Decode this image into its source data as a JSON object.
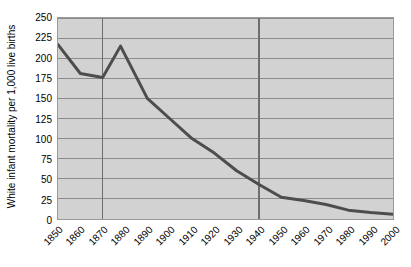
{
  "chart_data": {
    "type": "line",
    "title": "",
    "xlabel": "",
    "ylabel": "White infant mortality per 1,000 live births",
    "ylim": [
      0,
      250
    ],
    "yticks": [
      250,
      225,
      200,
      175,
      150,
      125,
      100,
      75,
      50,
      25,
      0
    ],
    "categories": [
      "1850",
      "1860",
      "1870",
      "1880",
      "1890",
      "1900",
      "1910",
      "1920",
      "1930",
      "1940",
      "1950",
      "1960",
      "1970",
      "1980",
      "1990",
      "2000"
    ],
    "x": [
      1850,
      1860,
      1870,
      1878,
      1890,
      1900,
      1910,
      1920,
      1930,
      1940,
      1950,
      1960,
      1970,
      1980,
      1990,
      2000
    ],
    "values": [
      217,
      181,
      176,
      215,
      150,
      125,
      100,
      82,
      60,
      43,
      27,
      23,
      18,
      11,
      8,
      6
    ],
    "series": [
      {
        "name": "White infant mortality rate",
        "values": [
          217,
          181,
          176,
          215,
          150,
          125,
          100,
          82,
          60,
          43,
          27,
          23,
          18,
          11,
          8,
          6
        ]
      }
    ],
    "grid": true,
    "grid_orientation": "horizontal",
    "legend": false,
    "emphasis_vertical_lines": [
      1870,
      1940
    ],
    "line_color": "#4d4d4d",
    "plot_background": "#d2d2d2",
    "gridline_color": "#8c8c8c",
    "axis_color": "#9a9a9a"
  }
}
